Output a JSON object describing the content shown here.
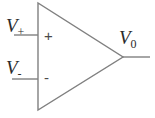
{
  "figure": {
    "kind": "op-amp-schematic-symbol",
    "background_color": "#ffffff",
    "line_color": "#808080",
    "text_color": "#2b2b2b"
  },
  "labels": {
    "noninverting_input": {
      "base": "V",
      "sub": "+"
    },
    "inverting_input": {
      "base": "V",
      "sub": "-"
    },
    "output": {
      "base": "V",
      "sub": "0"
    }
  },
  "terminal_signs": {
    "noninverting": "+",
    "inverting": "-"
  },
  "geometry": {
    "triangle": {
      "top_left_x": 38,
      "top_left_y": 3,
      "bottom_left_x": 38,
      "bottom_left_y": 110,
      "apex_x": 123,
      "apex_y": 57
    },
    "leads": [
      {
        "name": "noninverting-input-lead",
        "x1": 14,
        "y1": 35,
        "x2": 38,
        "y2": 35
      },
      {
        "name": "inverting-input-lead",
        "x1": 12,
        "y1": 79,
        "x2": 38,
        "y2": 79
      },
      {
        "name": "output-lead",
        "x1": 123,
        "y1": 57,
        "x2": 150,
        "y2": 57
      }
    ]
  }
}
